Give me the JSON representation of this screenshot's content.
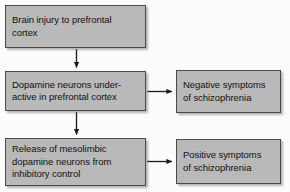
{
  "diagram": {
    "type": "flowchart",
    "background_color": "#fcfcfc",
    "node_fill_color": "#b9b9b9",
    "node_border_color": "#4a4a4a",
    "arrow_color": "#1a1a1a",
    "nodes": [
      {
        "id": "injury",
        "lines": [
          "Brain injury to prefrontal",
          "cortex"
        ],
        "column": "left",
        "row": 1
      },
      {
        "id": "underactive",
        "lines": [
          "Dopamine neurons under-",
          "active in prefrontal cortex"
        ],
        "column": "left",
        "row": 2
      },
      {
        "id": "release",
        "lines": [
          "Release of mesolimbic",
          "dopamine neurons from",
          "inhibitory control"
        ],
        "column": "left",
        "row": 3
      },
      {
        "id": "negative",
        "lines": [
          "Negative symptoms",
          "of schizophrenia"
        ],
        "column": "right",
        "row": 2
      },
      {
        "id": "positive",
        "lines": [
          "Positive symptoms",
          "of schizophrenia"
        ],
        "column": "right",
        "row": 3
      }
    ],
    "edges": [
      {
        "id": "injury-to-underactive",
        "from": "injury",
        "to": "underactive",
        "direction": "down"
      },
      {
        "id": "underactive-to-release",
        "from": "underactive",
        "to": "release",
        "direction": "down"
      },
      {
        "id": "underactive-to-negative",
        "from": "underactive",
        "to": "negative",
        "direction": "right"
      },
      {
        "id": "release-to-positive",
        "from": "release",
        "to": "positive",
        "direction": "right"
      }
    ]
  }
}
